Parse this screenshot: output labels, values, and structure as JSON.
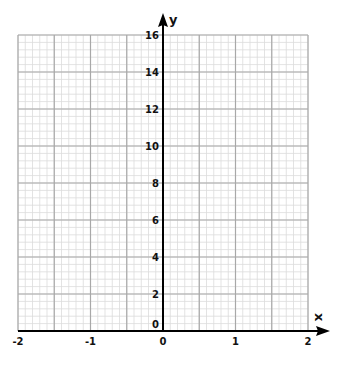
{
  "chart_data": {
    "type": "line",
    "title": "",
    "xlabel": "x",
    "ylabel": "y",
    "xlim": [
      -2,
      2
    ],
    "ylim": [
      0,
      16
    ],
    "x_ticks": [
      "-2",
      "-1",
      "0",
      "1",
      "2"
    ],
    "y_ticks": [
      "0",
      "2",
      "4",
      "6",
      "8",
      "10",
      "12",
      "14",
      "16"
    ],
    "grid": true,
    "grid_major_x_step": 0.5,
    "grid_major_y_step": 2,
    "grid_minor_subdivisions": 5,
    "series": []
  },
  "colors": {
    "axis": "#000000",
    "major_grid": "#a8a8a8",
    "minor_grid": "#dcdcdc"
  }
}
